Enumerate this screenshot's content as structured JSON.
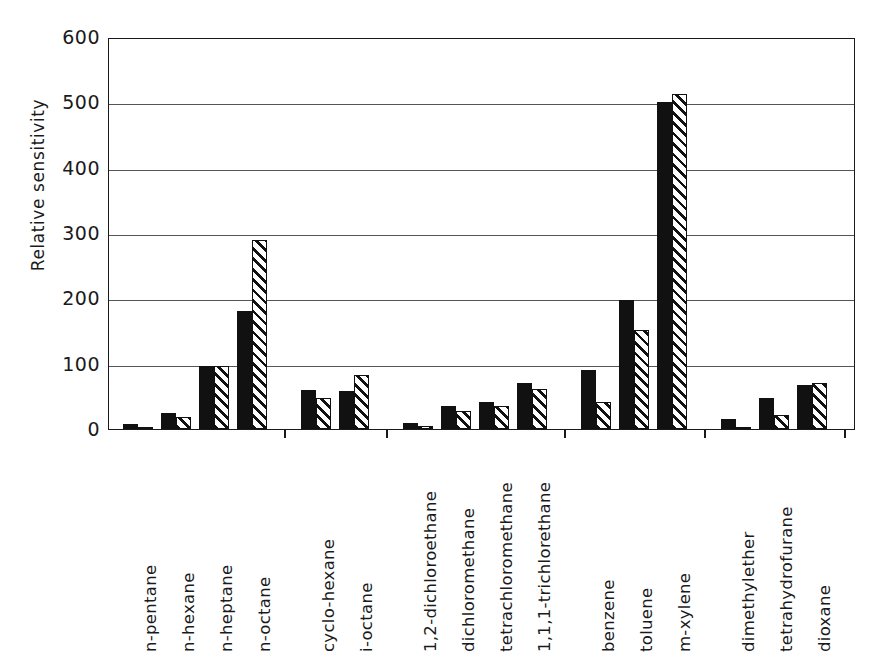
{
  "chart_data": {
    "type": "bar",
    "title": "",
    "subtitle": "",
    "xlabel": "",
    "ylabel": "Relative sensitivity",
    "ylim": [
      0,
      600
    ],
    "yticks": [
      0,
      100,
      200,
      300,
      400,
      500,
      600
    ],
    "ytick_labels": [
      "0",
      "100",
      "200",
      "300",
      "400",
      "500",
      "600"
    ],
    "grid": "horizontal",
    "legend_position": "none",
    "categories": [
      "n-pentane",
      "n-hexane",
      "n-heptane",
      "n-octane",
      "cyclo-hexane",
      "i-octane",
      "1,2-dichloroethane",
      "dichloromethane",
      "tetrachloromethane",
      "1,1,1-trichlorethane",
      "benzene",
      "toluene",
      "m-xylene",
      "dimethylether",
      "tetrahydrofurane",
      "dioxane"
    ],
    "groups": [
      {
        "name": "n-alkanes",
        "categories": [
          "n-pentane",
          "n-hexane",
          "n-heptane",
          "n-octane"
        ]
      },
      {
        "name": "branched-and-cyclic-alkanes",
        "categories": [
          "cyclo-hexane",
          "i-octane"
        ]
      },
      {
        "name": "chlorinated-hydrocarbons",
        "categories": [
          "1,2-dichloroethane",
          "dichloromethane",
          "tetrachloromethane",
          "1,1,1-trichlorethane"
        ]
      },
      {
        "name": "aromatics",
        "categories": [
          "benzene",
          "toluene",
          "m-xylene"
        ]
      },
      {
        "name": "ethers",
        "categories": [
          "dimethylether",
          "tetrahydrofurane",
          "dioxane"
        ]
      }
    ],
    "series": [
      {
        "name": "series-solid",
        "fill": "solid-black",
        "values": [
          8,
          25,
          97,
          180,
          60,
          58,
          9,
          35,
          42,
          70,
          90,
          197,
          500,
          15,
          48,
          68
        ]
      },
      {
        "name": "series-hatched",
        "fill": "diagonal-hatch",
        "values": [
          3,
          18,
          97,
          290,
          48,
          82,
          5,
          28,
          35,
          62,
          42,
          152,
          513,
          3,
          22,
          70
        ]
      }
    ]
  },
  "axes": {
    "y_title": "Relative sensitivity"
  }
}
